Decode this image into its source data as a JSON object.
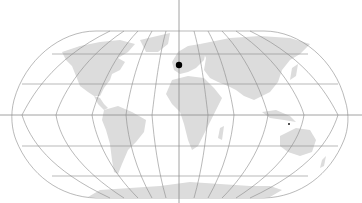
{
  "map": {
    "projection": "robinson",
    "colors": {
      "background": "#ffffff",
      "land": "#dcdcdc",
      "graticule": "#8a8a8a",
      "crosshair": "#8a8a8a",
      "marker": "#000000"
    },
    "marker": {
      "label": "location-marker",
      "x": 179,
      "y": 65
    },
    "crosshair": {
      "x": 179,
      "y": 115
    },
    "secondary_marker": {
      "x": 289,
      "y": 124
    }
  }
}
